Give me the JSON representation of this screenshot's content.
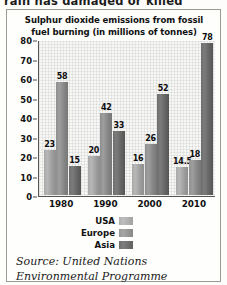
{
  "page": {
    "cutoff_text": "rain has damaged or killed"
  },
  "figure": {
    "title": "Sulphur dioxide emissions from fossil fuel burning (in millions of tonnes)",
    "title_line1": "Sulphur dioxide emissions from fossil",
    "title_line2": "fuel burning (in millions of tonnes)",
    "source_line1": "Source: United Nations",
    "source_line2": "Environmental Programme"
  },
  "legend": {
    "items": [
      {
        "label": "USA",
        "color": "#b0b0b0",
        "key": "usa"
      },
      {
        "label": "Europe",
        "color": "#979797",
        "key": "europe"
      },
      {
        "label": "Asia",
        "color": "#6f6f6f",
        "key": "asia"
      }
    ]
  },
  "chart_data": {
    "type": "bar",
    "title": "Sulphur dioxide emissions from fossil fuel burning (in millions of tonnes)",
    "xlabel": "",
    "ylabel": "",
    "ylim": [
      0,
      80
    ],
    "yticks": [
      80,
      70,
      60,
      50,
      40,
      30,
      20,
      10,
      0
    ],
    "ytick_labels": [
      "80",
      "70",
      "60",
      "50",
      "40",
      "30",
      "20",
      "10",
      "0"
    ],
    "grid": true,
    "legend_position": "below-left",
    "categories": [
      "1980",
      "1990",
      "2000",
      "2010"
    ],
    "series": [
      {
        "name": "USA",
        "color": "#b0b0b0",
        "values": [
          23,
          20,
          16,
          14.5
        ],
        "labels": [
          "23",
          "20",
          "16",
          "14.5"
        ]
      },
      {
        "name": "Europe",
        "color": "#979797",
        "values": [
          58,
          42,
          26,
          18
        ],
        "labels": [
          "58",
          "42",
          "26",
          "18"
        ]
      },
      {
        "name": "Asia",
        "color": "#6f6f6f",
        "values": [
          15,
          33,
          52,
          78
        ],
        "labels": [
          "15",
          "33",
          "52",
          "78"
        ]
      }
    ],
    "source": "Source: United Nations Environmental Programme"
  }
}
